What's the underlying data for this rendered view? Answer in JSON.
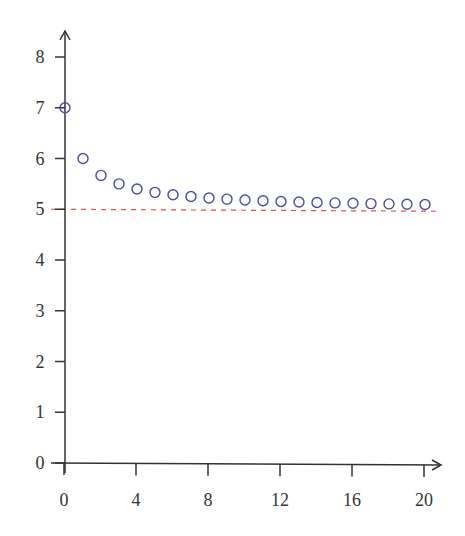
{
  "chart_data": {
    "type": "scatter",
    "title": "",
    "xlabel": "",
    "ylabel": "",
    "xlim": [
      0,
      20
    ],
    "ylim": [
      0,
      8
    ],
    "grid": false,
    "legend": null,
    "x_ticks": [
      0,
      4,
      8,
      12,
      16,
      20
    ],
    "y_ticks": [
      0,
      1,
      2,
      3,
      4,
      5,
      6,
      7,
      8
    ],
    "series": [
      {
        "name": "sequence",
        "marker": "open-circle",
        "color": "#4a4d9a",
        "x": [
          0,
          1,
          2,
          3,
          4,
          5,
          6,
          7,
          8,
          9,
          10,
          11,
          12,
          13,
          14,
          15,
          16,
          17,
          18,
          19,
          20
        ],
        "y": [
          7.0,
          6.0,
          5.667,
          5.5,
          5.4,
          5.333,
          5.286,
          5.25,
          5.222,
          5.2,
          5.182,
          5.167,
          5.154,
          5.143,
          5.133,
          5.125,
          5.118,
          5.111,
          5.105,
          5.1,
          5.095
        ]
      }
    ],
    "reference_lines": [
      {
        "orientation": "horizontal",
        "y": 5,
        "style": "dashed",
        "color": "#e8503a"
      }
    ],
    "axes_style": {
      "arrows": true,
      "color": "#333333"
    }
  }
}
